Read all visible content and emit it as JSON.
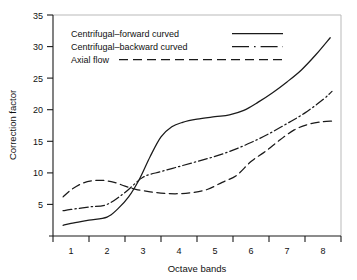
{
  "chart_data": {
    "type": "line",
    "title": "",
    "xlabel": "Octave bands",
    "ylabel": "Correction factor",
    "xlim": [
      0.5,
      8.5
    ],
    "ylim": [
      0,
      35
    ],
    "grid": false,
    "legend_position": "upper-left",
    "x_tick_labels": [
      "1",
      "2",
      "3",
      "4",
      "5",
      "6",
      "7",
      "8"
    ],
    "y_tick_labels": [
      "5",
      "10",
      "15",
      "20",
      "25",
      "30",
      "35"
    ],
    "y_ticks": [
      5,
      10,
      15,
      20,
      25,
      30,
      35
    ],
    "categories": [
      1,
      2,
      3,
      4,
      5,
      6,
      7,
      8
    ],
    "series": [
      {
        "name": "Centrifugal–forward curved",
        "style": "solid",
        "color": "#1a1a1a",
        "values": [
          1.7,
          3.0,
          9.0,
          18.0,
          18.9,
          21.5,
          26.0,
          32.0
        ],
        "x_dense": [
          0.78,
          1.0,
          1.5,
          2.0,
          2.3,
          2.6,
          2.9,
          3.2,
          3.5,
          3.8,
          4.1,
          4.5,
          5.0,
          5.4,
          5.8,
          6.2,
          6.6,
          7.0,
          7.4,
          7.8,
          8.2
        ],
        "y_dense": [
          1.7,
          2.0,
          2.5,
          3.0,
          4.3,
          6.2,
          9.0,
          12.6,
          15.7,
          17.3,
          18.0,
          18.5,
          18.9,
          19.2,
          19.9,
          21.2,
          22.7,
          24.4,
          26.3,
          28.7,
          31.4
        ]
      },
      {
        "name": "Centrifugal–backward curved",
        "style": "dash-dot",
        "color": "#1a1a1a",
        "values": [
          4.0,
          5.0,
          9.3,
          11.0,
          12.6,
          14.8,
          17.8,
          22.5
        ],
        "x_dense": [
          0.78,
          1.0,
          1.5,
          2.0,
          2.5,
          3.0,
          3.5,
          4.0,
          4.5,
          5.0,
          5.5,
          6.0,
          6.5,
          7.0,
          7.5,
          8.0,
          8.25
        ],
        "y_dense": [
          4.0,
          4.2,
          4.6,
          5.0,
          6.9,
          9.3,
          10.2,
          11.0,
          11.8,
          12.6,
          13.6,
          14.8,
          16.2,
          17.8,
          19.5,
          21.6,
          22.9
        ]
      },
      {
        "name": "Axial flow",
        "style": "dashed",
        "color": "#1a1a1a",
        "values": [
          7.8,
          8.8,
          7.4,
          6.7,
          8.5,
          11.8,
          16.2,
          18.2
        ],
        "x_dense": [
          0.78,
          1.0,
          1.3,
          1.6,
          1.9,
          2.2,
          2.5,
          2.8,
          3.2,
          3.6,
          4.0,
          4.4,
          4.8,
          5.2,
          5.6,
          6.0,
          6.4,
          6.8,
          7.2,
          7.6,
          8.0,
          8.25
        ],
        "y_dense": [
          6.2,
          7.3,
          8.3,
          8.75,
          8.8,
          8.5,
          7.9,
          7.4,
          7.0,
          6.75,
          6.7,
          6.9,
          7.4,
          8.5,
          9.6,
          11.8,
          13.4,
          15.2,
          16.8,
          17.7,
          18.1,
          18.2
        ]
      }
    ]
  },
  "legend": {
    "entries": [
      {
        "label": "Centrifugal–forward curved",
        "style": "solid"
      },
      {
        "label": "Centrifugal–backward curved",
        "style": "dash-dot"
      },
      {
        "label": "Axial flow",
        "style": "dashed"
      }
    ]
  }
}
